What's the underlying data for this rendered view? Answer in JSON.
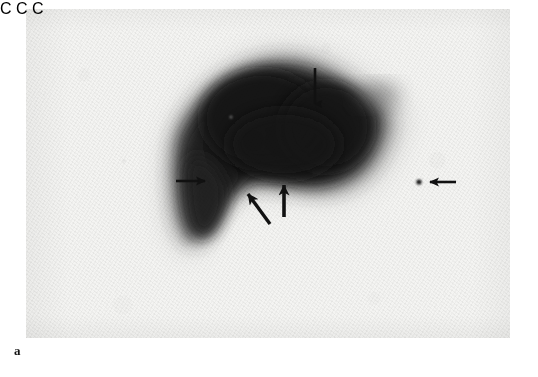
{
  "figure": {
    "panel_label": "a",
    "modality": "scintigraphy",
    "background_color": "#ffffff",
    "plate_color": "#f4f4f2",
    "ink_color": "#111111"
  },
  "scan": {
    "plate": {
      "x": 26,
      "y": 9,
      "width": 484,
      "height": 329
    },
    "uptake_region": {
      "label": "radiotracer-uptake-blob",
      "core_color": "#161616",
      "mid_color": "#3a3a3a",
      "halo_color": "#9a9a9a",
      "bounds": {
        "x": 160,
        "y": 55,
        "width": 220,
        "height": 190
      }
    },
    "focal_dot": {
      "label": "isolated-focal-uptake-dot",
      "x": 419,
      "y": 182,
      "radius": 2.6,
      "color": "#121212"
    }
  },
  "annotations": {
    "markers": [
      {
        "id": "marker-c-top",
        "letter": "C",
        "letter_x": 307,
        "letter_y": 50,
        "arrow": {
          "type": "down",
          "from_x": 315,
          "from_y": 68,
          "to_x": 315,
          "to_y": 104
        }
      },
      {
        "id": "marker-c-left",
        "letter": "C",
        "letter_x": 158,
        "letter_y": 172,
        "arrow": {
          "type": "right",
          "from_x": 176,
          "from_y": 181,
          "to_x": 208,
          "to_y": 181
        }
      },
      {
        "id": "marker-c-right",
        "letter": "C",
        "letter_x": 462,
        "letter_y": 172,
        "arrow": {
          "type": "left",
          "from_x": 456,
          "from_y": 182,
          "to_x": 427,
          "to_y": 182
        }
      }
    ],
    "plain_arrows": [
      {
        "id": "arrow-diagonal-up-left",
        "type": "diagonal",
        "from_x": 270,
        "from_y": 224,
        "to_x": 245,
        "to_y": 190
      },
      {
        "id": "arrow-vertical-up",
        "type": "up",
        "from_x": 284,
        "from_y": 217,
        "to_x": 284,
        "to_y": 181
      }
    ]
  }
}
